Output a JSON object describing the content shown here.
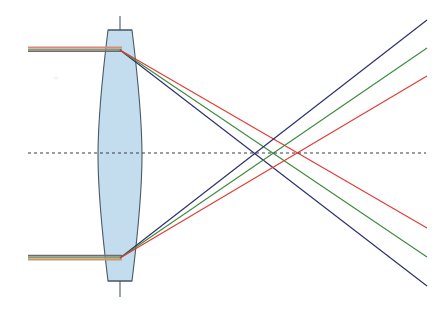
{
  "figure": {
    "caption": "",
    "width": 437,
    "height": 311,
    "background_color": "#ffffff"
  },
  "colors": {
    "lens_fill": "#c3dcee",
    "lens_stroke": "#4a5a66",
    "axis": "#3b3b4a",
    "optical_axis_vertical": "#4a5a66",
    "ray_blue": "#2b2f6e",
    "ray_green": "#3c8a3c",
    "ray_red": "#e03a30",
    "ray_incoming_red": "#d98a78",
    "ray_incoming_green": "#8a9a78",
    "ray_incoming_blue": "#6b6b70",
    "ray_incoming_tan": "#c79a6a"
  },
  "lens": {
    "label": "biconvex-lens",
    "center_x": 120,
    "top_y": 30,
    "bottom_y": 281,
    "half_thickness": 22,
    "flange_top_y": 30,
    "flange_bottom_y": 281,
    "fill": "#c3dcee",
    "stroke": "#4a5a66",
    "stroke_width": 1.1
  },
  "optical_axis_vertical": {
    "label": "lens-plane-axis",
    "x": 120,
    "y_start": 16,
    "y_end": 297,
    "color": "#4a5a66",
    "width": 1.1
  },
  "optical_axis_horizontal": {
    "label": "optical-axis",
    "y": 153,
    "x_start": 28,
    "x_end": 426,
    "color": "#3b3b4a",
    "dash": "3 3",
    "width": 1.2
  },
  "chart_data": {
    "type": "line",
    "xlabel": "",
    "ylabel": "",
    "focal_points": [
      {
        "name": "blue focus",
        "color": "#2b2f6e",
        "x": 254,
        "y": 153
      },
      {
        "name": "green focus",
        "color": "#3c8a3c",
        "x": 273,
        "y": 153
      },
      {
        "name": "red focus",
        "color": "#e03a30",
        "x": 298,
        "y": 153
      }
    ],
    "entry_points": [
      {
        "name": "upper ray entry",
        "x": 120,
        "y": 50
      },
      {
        "name": "lower ray entry",
        "x": 120,
        "y": 258
      }
    ],
    "series": [
      {
        "name": "blue ray upper",
        "color": "#2b2f6e",
        "points": [
          [
            120,
            50
          ],
          [
            254,
            153
          ],
          [
            427,
            286
          ]
        ]
      },
      {
        "name": "green ray upper",
        "color": "#3c8a3c",
        "points": [
          [
            120,
            50
          ],
          [
            273,
            153
          ],
          [
            427,
            257
          ]
        ]
      },
      {
        "name": "red ray upper",
        "color": "#e03a30",
        "points": [
          [
            120,
            50
          ],
          [
            298,
            153
          ],
          [
            427,
            228
          ]
        ]
      },
      {
        "name": "blue ray lower",
        "color": "#2b2f6e",
        "points": [
          [
            120,
            258
          ],
          [
            254,
            153
          ],
          [
            427,
            20
          ]
        ]
      },
      {
        "name": "green ray lower",
        "color": "#3c8a3c",
        "points": [
          [
            120,
            258
          ],
          [
            273,
            153
          ],
          [
            427,
            48
          ]
        ]
      },
      {
        "name": "red ray lower",
        "color": "#e03a30",
        "points": [
          [
            120,
            258
          ],
          [
            298,
            153
          ],
          [
            427,
            76
          ]
        ]
      }
    ],
    "incoming_rays": [
      {
        "name": "upper incoming bundle",
        "x_start": 28,
        "x_end": 122,
        "y": 50
      },
      {
        "name": "lower incoming bundle",
        "x_start": 28,
        "x_end": 122,
        "y": 258
      }
    ],
    "legend": [],
    "grid": false
  }
}
